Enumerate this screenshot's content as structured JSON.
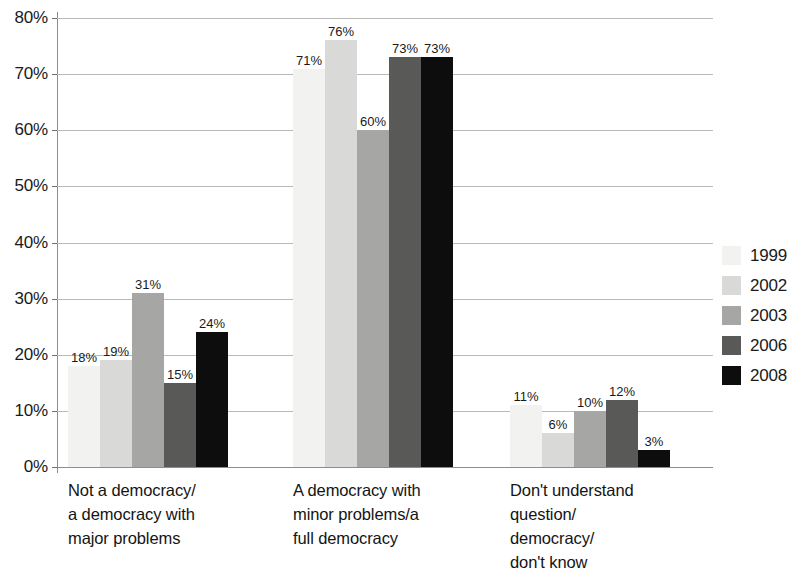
{
  "chart_data": {
    "type": "bar",
    "title": "",
    "subtitle": "",
    "xlabel": "",
    "ylabel": "",
    "ylim": [
      0,
      80
    ],
    "y_tick_step": 10,
    "y_tick_labels": [
      "0%",
      "10%",
      "20%",
      "30%",
      "40%",
      "50%",
      "60%",
      "70%",
      "80%"
    ],
    "grid": true,
    "legend_position": "right",
    "value_label_suffix": "%",
    "categories": [
      "Not a democracy/\na democracy with\nmajor problems",
      "A democracy with\nminor problems/a\nfull democracy",
      "Don't understand\nquestion/\ndemocracy/\ndon't know"
    ],
    "category_lines": [
      [
        "Not a democracy/",
        "a democracy with",
        "major problems"
      ],
      [
        "A democracy with",
        "minor problems/a",
        "full democracy"
      ],
      [
        "Don't understand",
        "question/",
        "democracy/",
        "don't know"
      ]
    ],
    "series": [
      {
        "name": "1999",
        "color": "#f2f2f0",
        "values": [
          18,
          71,
          11
        ],
        "labels": [
          "18%",
          "71%",
          "11%"
        ]
      },
      {
        "name": "2002",
        "color": "#d9d9d7",
        "values": [
          19,
          76,
          6
        ],
        "labels": [
          "19%",
          "76%",
          "6%"
        ]
      },
      {
        "name": "2003",
        "color": "#a6a6a4",
        "values": [
          31,
          60,
          10
        ],
        "labels": [
          "31%",
          "60%",
          "10%"
        ]
      },
      {
        "name": "2006",
        "color": "#595957",
        "values": [
          15,
          73,
          12
        ],
        "labels": [
          "15%",
          "73%",
          "12%"
        ]
      },
      {
        "name": "2008",
        "color": "#0d0d0d",
        "values": [
          24,
          73,
          3
        ],
        "labels": [
          "24%",
          "73%",
          "3%"
        ]
      }
    ]
  },
  "legend": {
    "items": [
      {
        "label": "1999",
        "color": "#f2f2f0"
      },
      {
        "label": "2002",
        "color": "#d9d9d7"
      },
      {
        "label": "2003",
        "color": "#a6a6a4"
      },
      {
        "label": "2006",
        "color": "#595957"
      },
      {
        "label": "2008",
        "color": "#0d0d0d"
      }
    ]
  },
  "axis": {
    "y_labels": [
      "80%",
      "70%",
      "60%",
      "50%",
      "40%",
      "30%",
      "20%",
      "10%",
      "0%"
    ]
  },
  "colors": {
    "gridline": "#b9b9b9",
    "axis": "#8d8d8d",
    "text": "#1a1a1a",
    "background": "#ffffff"
  }
}
